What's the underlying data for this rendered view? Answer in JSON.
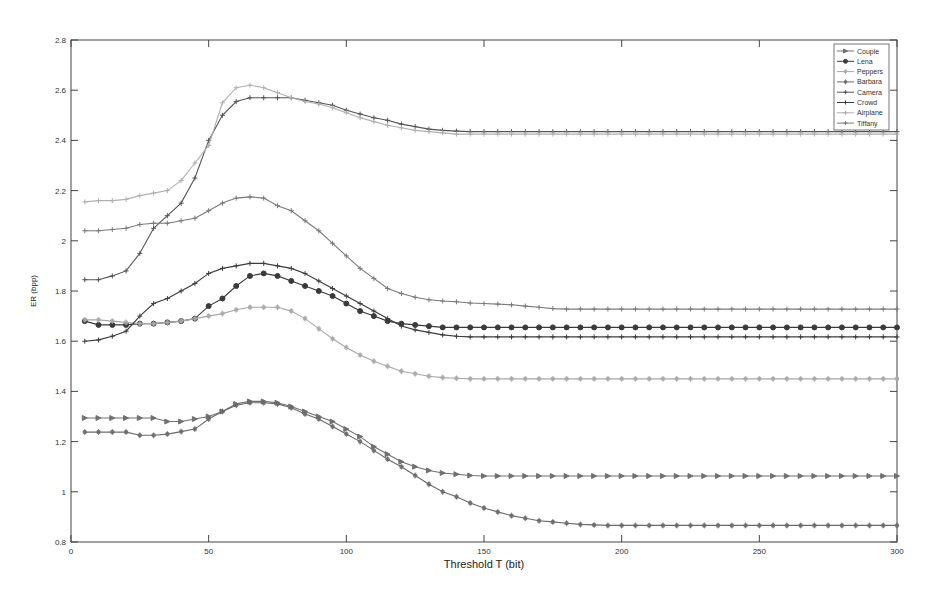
{
  "chart_data": {
    "type": "line",
    "title": "",
    "xlabel": "Threshold T (bit)",
    "ylabel": "ER (bpp)",
    "xlim": [
      0,
      300
    ],
    "ylim": [
      0.8,
      2.8
    ],
    "xticks": [
      0,
      50,
      100,
      150,
      200,
      250,
      300
    ],
    "yticks": [
      0.8,
      1,
      1.2,
      1.4,
      1.6,
      1.8,
      2,
      2.2,
      2.4,
      2.6,
      2.8
    ],
    "ytick_labels": [
      "0.8",
      "1",
      "1.2",
      "1.4",
      "1.6",
      "1.8",
      "2",
      "2.2",
      "2.4",
      "2.6",
      "2.8"
    ],
    "grid": false,
    "legend_position": "top-right",
    "x": [
      5,
      10,
      15,
      20,
      25,
      30,
      35,
      40,
      45,
      50,
      55,
      60,
      65,
      70,
      75,
      80,
      85,
      90,
      95,
      100,
      105,
      110,
      115,
      120,
      125,
      130,
      135,
      140,
      145,
      150,
      155,
      160,
      165,
      170,
      175,
      180,
      185,
      190,
      195,
      200,
      205,
      210,
      215,
      220,
      225,
      230,
      235,
      240,
      245,
      250,
      255,
      260,
      265,
      270,
      275,
      280,
      285,
      290,
      295,
      300
    ],
    "series": [
      {
        "name": "Couple",
        "marker": "triangle",
        "color": "#707070",
        "values": [
          1.294,
          1.294,
          1.294,
          1.294,
          1.294,
          1.294,
          1.28,
          1.28,
          1.29,
          1.3,
          1.32,
          1.35,
          1.36,
          1.36,
          1.355,
          1.34,
          1.32,
          1.3,
          1.28,
          1.25,
          1.22,
          1.18,
          1.15,
          1.12,
          1.1,
          1.085,
          1.075,
          1.07,
          1.065,
          1.063,
          1.063,
          1.063,
          1.063,
          1.063,
          1.063,
          1.063,
          1.063,
          1.063,
          1.063,
          1.063,
          1.063,
          1.063,
          1.063,
          1.063,
          1.063,
          1.063,
          1.063,
          1.063,
          1.063,
          1.063,
          1.063,
          1.063,
          1.063,
          1.063,
          1.063,
          1.063,
          1.063,
          1.063,
          1.063,
          1.063
        ]
      },
      {
        "name": "Lena",
        "marker": "dot",
        "color": "#3a3a3a",
        "values": [
          1.68,
          1.665,
          1.665,
          1.665,
          1.67,
          1.67,
          1.675,
          1.68,
          1.69,
          1.74,
          1.77,
          1.82,
          1.86,
          1.87,
          1.86,
          1.84,
          1.82,
          1.8,
          1.78,
          1.75,
          1.72,
          1.7,
          1.68,
          1.67,
          1.665,
          1.66,
          1.655,
          1.655,
          1.655,
          1.655,
          1.655,
          1.655,
          1.655,
          1.655,
          1.655,
          1.655,
          1.655,
          1.655,
          1.655,
          1.655,
          1.655,
          1.655,
          1.655,
          1.655,
          1.655,
          1.655,
          1.655,
          1.655,
          1.655,
          1.655,
          1.655,
          1.655,
          1.655,
          1.655,
          1.655,
          1.655,
          1.655,
          1.655,
          1.655,
          1.655
        ]
      },
      {
        "name": "Peppers",
        "marker": "star",
        "color": "#a8a8a8",
        "values": [
          1.685,
          1.685,
          1.68,
          1.675,
          1.67,
          1.67,
          1.675,
          1.68,
          1.69,
          1.7,
          1.71,
          1.725,
          1.735,
          1.735,
          1.735,
          1.72,
          1.69,
          1.65,
          1.61,
          1.575,
          1.545,
          1.52,
          1.5,
          1.48,
          1.47,
          1.46,
          1.455,
          1.452,
          1.45,
          1.45,
          1.45,
          1.45,
          1.45,
          1.45,
          1.45,
          1.45,
          1.45,
          1.45,
          1.45,
          1.45,
          1.45,
          1.45,
          1.45,
          1.45,
          1.45,
          1.45,
          1.45,
          1.45,
          1.45,
          1.45,
          1.45,
          1.45,
          1.45,
          1.45,
          1.45,
          1.45,
          1.45,
          1.45,
          1.45,
          1.45
        ]
      },
      {
        "name": "Barbara",
        "marker": "star",
        "color": "#6a6a6a",
        "values": [
          1.238,
          1.238,
          1.238,
          1.238,
          1.225,
          1.225,
          1.23,
          1.24,
          1.25,
          1.29,
          1.32,
          1.345,
          1.355,
          1.355,
          1.35,
          1.335,
          1.31,
          1.29,
          1.26,
          1.23,
          1.2,
          1.165,
          1.13,
          1.1,
          1.065,
          1.03,
          1.0,
          0.98,
          0.955,
          0.935,
          0.92,
          0.905,
          0.895,
          0.885,
          0.88,
          0.875,
          0.87,
          0.868,
          0.866,
          0.866,
          0.866,
          0.866,
          0.866,
          0.866,
          0.866,
          0.866,
          0.866,
          0.866,
          0.866,
          0.866,
          0.866,
          0.866,
          0.866,
          0.866,
          0.866,
          0.866,
          0.866,
          0.866,
          0.866,
          0.866
        ]
      },
      {
        "name": "Camera",
        "marker": "plus",
        "color": "#555555",
        "values": [
          1.845,
          1.845,
          1.86,
          1.88,
          1.95,
          2.05,
          2.1,
          2.15,
          2.25,
          2.4,
          2.5,
          2.555,
          2.57,
          2.57,
          2.57,
          2.57,
          2.56,
          2.55,
          2.54,
          2.52,
          2.505,
          2.49,
          2.48,
          2.465,
          2.455,
          2.445,
          2.44,
          2.437,
          2.435,
          2.435,
          2.435,
          2.435,
          2.435,
          2.435,
          2.435,
          2.435,
          2.435,
          2.435,
          2.435,
          2.435,
          2.435,
          2.435,
          2.435,
          2.435,
          2.435,
          2.435,
          2.435,
          2.435,
          2.435,
          2.435,
          2.435,
          2.435,
          2.435,
          2.435,
          2.435,
          2.435,
          2.435,
          2.435,
          2.435,
          2.435
        ]
      },
      {
        "name": "Crowd",
        "marker": "plus",
        "color": "#3c3c3c",
        "values": [
          1.6,
          1.605,
          1.62,
          1.64,
          1.7,
          1.75,
          1.77,
          1.8,
          1.83,
          1.87,
          1.89,
          1.9,
          1.91,
          1.91,
          1.9,
          1.89,
          1.87,
          1.84,
          1.81,
          1.78,
          1.75,
          1.72,
          1.69,
          1.66,
          1.645,
          1.635,
          1.625,
          1.62,
          1.617,
          1.617,
          1.617,
          1.617,
          1.617,
          1.617,
          1.617,
          1.617,
          1.617,
          1.617,
          1.617,
          1.617,
          1.617,
          1.617,
          1.617,
          1.617,
          1.617,
          1.617,
          1.617,
          1.617,
          1.617,
          1.617,
          1.617,
          1.617,
          1.617,
          1.617,
          1.617,
          1.617,
          1.617,
          1.617,
          1.617,
          1.617
        ]
      },
      {
        "name": "Airplane",
        "marker": "plus",
        "color": "#b0b0b0",
        "values": [
          2.155,
          2.16,
          2.16,
          2.165,
          2.18,
          2.19,
          2.2,
          2.24,
          2.31,
          2.38,
          2.55,
          2.61,
          2.62,
          2.61,
          2.59,
          2.57,
          2.555,
          2.545,
          2.53,
          2.51,
          2.49,
          2.475,
          2.46,
          2.45,
          2.44,
          2.435,
          2.43,
          2.425,
          2.425,
          2.425,
          2.425,
          2.425,
          2.425,
          2.425,
          2.425,
          2.425,
          2.425,
          2.425,
          2.425,
          2.425,
          2.425,
          2.425,
          2.425,
          2.425,
          2.425,
          2.425,
          2.425,
          2.425,
          2.425,
          2.425,
          2.425,
          2.425,
          2.425,
          2.425,
          2.425,
          2.425,
          2.425,
          2.425,
          2.425,
          2.425
        ]
      },
      {
        "name": "Tiffany",
        "marker": "plus",
        "color": "#7a7a7a",
        "values": [
          2.04,
          2.04,
          2.045,
          2.05,
          2.065,
          2.07,
          2.07,
          2.08,
          2.09,
          2.12,
          2.15,
          2.17,
          2.175,
          2.17,
          2.14,
          2.12,
          2.08,
          2.04,
          1.99,
          1.94,
          1.89,
          1.85,
          1.81,
          1.79,
          1.775,
          1.765,
          1.76,
          1.757,
          1.752,
          1.75,
          1.748,
          1.745,
          1.74,
          1.735,
          1.73,
          1.728,
          1.728,
          1.728,
          1.728,
          1.728,
          1.728,
          1.728,
          1.728,
          1.728,
          1.728,
          1.728,
          1.728,
          1.728,
          1.728,
          1.728,
          1.728,
          1.728,
          1.728,
          1.728,
          1.728,
          1.728,
          1.728,
          1.728,
          1.728,
          1.728
        ]
      }
    ]
  }
}
